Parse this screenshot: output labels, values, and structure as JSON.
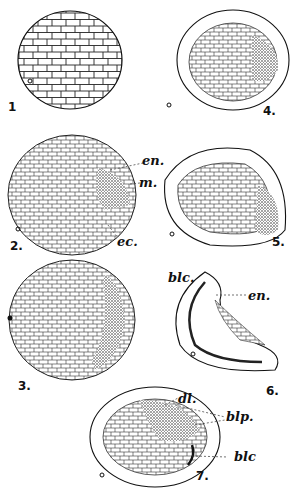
{
  "figure": {
    "stroke_color": "#1a1a1a",
    "stipple_color": "#555555",
    "background": "#ffffff",
    "panels": [
      {
        "number": "1",
        "stage": "morula"
      },
      {
        "number": "2.",
        "labels": [
          "en.",
          "m.",
          "ec."
        ]
      },
      {
        "number": "3."
      },
      {
        "number": "4."
      },
      {
        "number": "5."
      },
      {
        "number": "6.",
        "labels": [
          "blc.",
          "en."
        ]
      },
      {
        "number": "7.",
        "labels": [
          "dl.",
          "blp.",
          "blc"
        ]
      }
    ]
  },
  "labels": {
    "p1": "1",
    "p2": "2.",
    "p3": "3.",
    "p4": "4.",
    "p5": "5.",
    "p6": "6.",
    "p7": "7.",
    "en_2": "en.",
    "m_2": "m.",
    "ec_2": "ec.",
    "blc_6": "blc.",
    "en_6": "en.",
    "dl_7": "dl.",
    "blp_7": "blp.",
    "blc_7": "blc"
  }
}
